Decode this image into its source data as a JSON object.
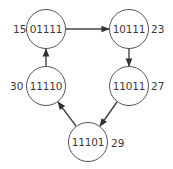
{
  "diagram": {
    "type": "directed-cycle",
    "colors": {
      "stroke": "#555555",
      "text": "#3a3a3a",
      "background": "#ffffff"
    },
    "nodes": [
      {
        "id": "n0",
        "label": "01111",
        "value": "15",
        "value_side": "left"
      },
      {
        "id": "n1",
        "label": "10111",
        "value": "23",
        "value_side": "right"
      },
      {
        "id": "n2",
        "label": "11011",
        "value": "27",
        "value_side": "right"
      },
      {
        "id": "n3",
        "label": "11101",
        "value": "29",
        "value_side": "right"
      },
      {
        "id": "n4",
        "label": "11110",
        "value": "30",
        "value_side": "left"
      }
    ],
    "edges": [
      {
        "from": "01111",
        "to": "10111"
      },
      {
        "from": "10111",
        "to": "11011"
      },
      {
        "from": "11011",
        "to": "11101"
      },
      {
        "from": "11101",
        "to": "11110"
      },
      {
        "from": "11110",
        "to": "01111"
      }
    ]
  }
}
